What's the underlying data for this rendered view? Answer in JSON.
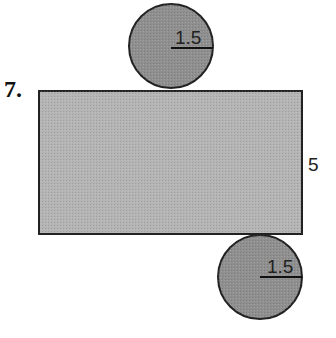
{
  "problem": {
    "number": "7.",
    "top_circle": {
      "radius_label": "1.5",
      "fill": "#8f8f8f"
    },
    "rectangle": {
      "height_label": "5",
      "fill": "#b4b4b4"
    },
    "bottom_circle": {
      "radius_label": "1.5",
      "fill": "#8f8f8f"
    },
    "stroke": "#222222"
  }
}
